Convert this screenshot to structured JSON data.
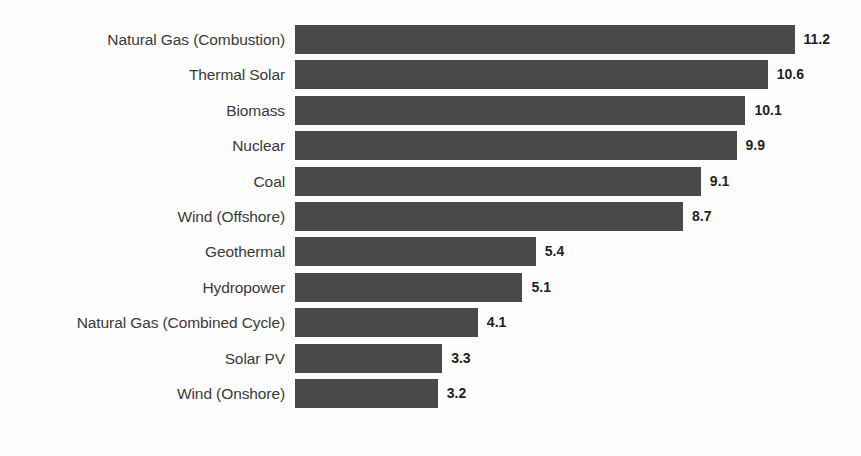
{
  "chart_data": {
    "type": "bar",
    "orientation": "horizontal",
    "title": "",
    "subtitle": "",
    "xlabel": "",
    "ylabel": "",
    "grid": false,
    "legend": false,
    "xlim": [
      0,
      12.6
    ],
    "categories": [
      "Natural Gas (Combustion)",
      "Thermal Solar",
      "Biomass",
      "Nuclear",
      "Coal",
      "Wind (Offshore)",
      "Geothermal",
      "Hydropower",
      "Natural Gas (Combined Cycle)",
      "Solar PV",
      "Wind (Onshore)"
    ],
    "values": [
      11.2,
      10.6,
      10.1,
      9.9,
      9.1,
      8.7,
      5.4,
      5.1,
      4.1,
      3.3,
      3.2
    ],
    "value_labels": [
      "11.2",
      "10.6",
      "10.1",
      "9.9",
      "9.1",
      "8.7",
      "5.4",
      "5.1",
      "4.1",
      "3.3",
      "3.2"
    ],
    "bar_color": "#4a4a4a",
    "label_color": "#3a3a3a",
    "value_label_color": "#1f1f1f",
    "background_color": "#fdfdfd"
  },
  "bottom_cut_text": "............."
}
